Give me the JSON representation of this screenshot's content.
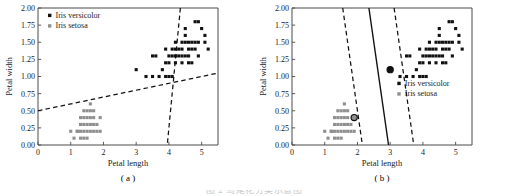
{
  "figure": {
    "caption": "图 2 鸢尾花分类示意图",
    "panels": [
      {
        "key": "a",
        "label": "( a )"
      },
      {
        "key": "b",
        "label": "( b )"
      }
    ]
  },
  "chart_data": [
    {
      "type": "scatter",
      "panel": "a",
      "title": "",
      "xlabel": "Petal length",
      "ylabel": "Petal width",
      "xlim": [
        0,
        5.5
      ],
      "ylim": [
        0.0,
        2.0
      ],
      "xticks": [
        0,
        1,
        2,
        3,
        4,
        5
      ],
      "xticklabels": [
        "0",
        "1",
        "2",
        "3",
        "4",
        "5"
      ],
      "yticks": [
        0.0,
        0.25,
        0.5,
        0.75,
        1.0,
        1.25,
        1.5,
        1.75,
        2.0
      ],
      "yticklabels": [
        "0.00",
        "0.25",
        "0.50",
        "0.75",
        "1.00",
        "1.25",
        "1.50",
        "1.75",
        "2.00"
      ],
      "grid": false,
      "legend_position": "top-left",
      "series": [
        {
          "name": "Iris versicolor",
          "marker": "square",
          "color": "#111111",
          "points": [
            [
              3.0,
              1.1
            ],
            [
              3.3,
              1.0
            ],
            [
              3.5,
              1.0
            ],
            [
              3.6,
              1.3
            ],
            [
              3.7,
              1.0
            ],
            [
              3.8,
              1.1
            ],
            [
              3.9,
              1.2
            ],
            [
              3.9,
              1.4
            ],
            [
              3.9,
              1.0
            ],
            [
              4.0,
              1.0
            ],
            [
              4.0,
              1.3
            ],
            [
              4.1,
              1.0
            ],
            [
              4.1,
              1.3
            ],
            [
              4.2,
              1.2
            ],
            [
              4.2,
              1.3
            ],
            [
              4.2,
              1.5
            ],
            [
              4.3,
              1.3
            ],
            [
              4.4,
              1.2
            ],
            [
              4.4,
              1.3
            ],
            [
              4.4,
              1.4
            ],
            [
              4.5,
              1.3
            ],
            [
              4.5,
              1.5
            ],
            [
              4.5,
              1.6
            ],
            [
              4.5,
              1.7
            ],
            [
              4.6,
              1.3
            ],
            [
              4.6,
              1.4
            ],
            [
              4.6,
              1.5
            ],
            [
              4.7,
              1.2
            ],
            [
              4.7,
              1.4
            ],
            [
              4.7,
              1.5
            ],
            [
              4.8,
              1.4
            ],
            [
              4.8,
              1.8
            ],
            [
              4.9,
              1.5
            ],
            [
              4.9,
              1.8
            ],
            [
              5.0,
              1.7
            ],
            [
              5.1,
              1.5
            ],
            [
              5.1,
              1.6
            ],
            [
              5.2,
              1.4
            ],
            [
              4.0,
              1.2
            ],
            [
              4.3,
              1.4
            ],
            [
              4.6,
              1.2
            ],
            [
              4.1,
              1.4
            ],
            [
              3.5,
              1.3
            ],
            [
              4.8,
              1.5
            ],
            [
              4.9,
              1.3
            ],
            [
              4.4,
              1.5
            ],
            [
              4.2,
              1.4
            ]
          ]
        },
        {
          "name": "Iris setosa",
          "marker": "square",
          "color": "#8f8f8f",
          "points": [
            [
              1.0,
              0.2
            ],
            [
              1.1,
              0.1
            ],
            [
              1.2,
              0.2
            ],
            [
              1.3,
              0.2
            ],
            [
              1.3,
              0.3
            ],
            [
              1.3,
              0.4
            ],
            [
              1.4,
              0.1
            ],
            [
              1.4,
              0.2
            ],
            [
              1.4,
              0.3
            ],
            [
              1.5,
              0.1
            ],
            [
              1.5,
              0.2
            ],
            [
              1.5,
              0.3
            ],
            [
              1.5,
              0.4
            ],
            [
              1.6,
              0.2
            ],
            [
              1.6,
              0.4
            ],
            [
              1.6,
              0.6
            ],
            [
              1.7,
              0.2
            ],
            [
              1.7,
              0.3
            ],
            [
              1.7,
              0.4
            ],
            [
              1.7,
              0.5
            ],
            [
              1.9,
              0.2
            ],
            [
              1.9,
              0.4
            ],
            [
              1.6,
              0.5
            ],
            [
              1.4,
              0.4
            ],
            [
              1.5,
              0.5
            ],
            [
              1.2,
              0.2
            ],
            [
              1.3,
              0.1
            ],
            [
              1.8,
              0.2
            ],
            [
              1.8,
              0.3
            ],
            [
              1.6,
              0.3
            ],
            [
              1.4,
              0.5
            ]
          ]
        }
      ],
      "lines": [
        {
          "name": "boundary-shallow",
          "style": "dashed",
          "x1": 0.0,
          "y1": 0.5,
          "x2": 5.5,
          "y2": 1.05
        },
        {
          "name": "boundary-steep",
          "style": "dashed",
          "x1": 4.35,
          "y1": 2.0,
          "x2": 3.95,
          "y2": 0.0
        }
      ]
    },
    {
      "type": "scatter",
      "panel": "b",
      "title": "",
      "xlabel": "Petal length",
      "ylabel": "Petal width",
      "xlim": [
        0,
        5.5
      ],
      "ylim": [
        0.0,
        2.0
      ],
      "xticks": [
        0,
        1,
        2,
        3,
        4,
        5
      ],
      "xticklabels": [
        "0",
        "1",
        "2",
        "3",
        "4",
        "5"
      ],
      "yticks": [
        0.0,
        0.25,
        0.5,
        0.75,
        1.0,
        1.25,
        1.5,
        1.75,
        2.0
      ],
      "yticklabels": [
        "0.00",
        "0.25",
        "0.50",
        "0.75",
        "1.00",
        "1.25",
        "1.50",
        "1.75",
        "2.00"
      ],
      "grid": false,
      "legend_position": "lower-right",
      "series": [
        {
          "name": "Iris versicolor",
          "marker": "square",
          "color": "#111111",
          "points": [
            [
              3.0,
              1.1
            ],
            [
              3.3,
              1.0
            ],
            [
              3.5,
              1.0
            ],
            [
              3.6,
              1.3
            ],
            [
              3.7,
              1.0
            ],
            [
              3.8,
              1.1
            ],
            [
              3.9,
              1.2
            ],
            [
              3.9,
              1.4
            ],
            [
              3.9,
              1.0
            ],
            [
              4.0,
              1.0
            ],
            [
              4.0,
              1.3
            ],
            [
              4.1,
              1.0
            ],
            [
              4.1,
              1.3
            ],
            [
              4.2,
              1.2
            ],
            [
              4.2,
              1.3
            ],
            [
              4.2,
              1.5
            ],
            [
              4.3,
              1.3
            ],
            [
              4.4,
              1.2
            ],
            [
              4.4,
              1.3
            ],
            [
              4.4,
              1.4
            ],
            [
              4.5,
              1.3
            ],
            [
              4.5,
              1.5
            ],
            [
              4.5,
              1.6
            ],
            [
              4.5,
              1.7
            ],
            [
              4.6,
              1.3
            ],
            [
              4.6,
              1.4
            ],
            [
              4.6,
              1.5
            ],
            [
              4.7,
              1.2
            ],
            [
              4.7,
              1.4
            ],
            [
              4.7,
              1.5
            ],
            [
              4.8,
              1.4
            ],
            [
              4.8,
              1.8
            ],
            [
              4.9,
              1.5
            ],
            [
              4.9,
              1.8
            ],
            [
              5.0,
              1.7
            ],
            [
              5.1,
              1.5
            ],
            [
              5.1,
              1.6
            ],
            [
              5.2,
              1.4
            ],
            [
              4.0,
              1.2
            ],
            [
              4.3,
              1.4
            ],
            [
              4.6,
              1.2
            ],
            [
              4.1,
              1.4
            ],
            [
              3.5,
              1.3
            ],
            [
              4.8,
              1.5
            ],
            [
              4.9,
              1.3
            ],
            [
              4.4,
              1.5
            ],
            [
              4.2,
              1.4
            ]
          ]
        },
        {
          "name": "Iris setosa",
          "marker": "square",
          "color": "#8f8f8f",
          "points": [
            [
              1.0,
              0.2
            ],
            [
              1.1,
              0.1
            ],
            [
              1.2,
              0.2
            ],
            [
              1.3,
              0.2
            ],
            [
              1.3,
              0.3
            ],
            [
              1.3,
              0.4
            ],
            [
              1.4,
              0.1
            ],
            [
              1.4,
              0.2
            ],
            [
              1.4,
              0.3
            ],
            [
              1.5,
              0.1
            ],
            [
              1.5,
              0.2
            ],
            [
              1.5,
              0.3
            ],
            [
              1.5,
              0.4
            ],
            [
              1.6,
              0.2
            ],
            [
              1.6,
              0.4
            ],
            [
              1.6,
              0.6
            ],
            [
              1.7,
              0.2
            ],
            [
              1.7,
              0.3
            ],
            [
              1.7,
              0.4
            ],
            [
              1.7,
              0.5
            ],
            [
              1.9,
              0.2
            ],
            [
              1.9,
              0.4
            ],
            [
              1.6,
              0.5
            ],
            [
              1.4,
              0.4
            ],
            [
              1.5,
              0.5
            ],
            [
              1.2,
              0.2
            ],
            [
              1.3,
              0.1
            ],
            [
              1.8,
              0.2
            ],
            [
              1.8,
              0.3
            ],
            [
              1.6,
              0.3
            ],
            [
              1.4,
              0.5
            ]
          ]
        }
      ],
      "support_vectors": [
        {
          "x": 1.9,
          "y": 0.4,
          "class": "Iris setosa"
        },
        {
          "x": 3.0,
          "y": 1.1,
          "class": "Iris versicolor"
        }
      ],
      "lines": [
        {
          "name": "margin-lower",
          "style": "dashed",
          "x1": 1.55,
          "y1": 2.0,
          "x2": 2.15,
          "y2": 0.0
        },
        {
          "name": "decision-boundary",
          "style": "solid",
          "x1": 2.35,
          "y1": 2.0,
          "x2": 2.95,
          "y2": 0.0
        },
        {
          "name": "margin-upper",
          "style": "dashed",
          "x1": 3.12,
          "y1": 2.0,
          "x2": 3.72,
          "y2": 0.0
        }
      ]
    }
  ]
}
